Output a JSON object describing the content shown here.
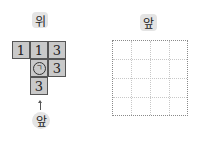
{
  "top_view": {
    "label": "위",
    "cells": [
      {
        "row": 0,
        "col": 0,
        "value": "1"
      },
      {
        "row": 0,
        "col": 1,
        "value": "1"
      },
      {
        "row": 0,
        "col": 2,
        "value": "3"
      },
      {
        "row": 1,
        "col": 1,
        "value": "ㄱ",
        "circled": true
      },
      {
        "row": 1,
        "col": 2,
        "value": "3"
      },
      {
        "row": 2,
        "col": 1,
        "value": "3"
      }
    ],
    "front_label": "앞",
    "arrow_icon": "arrow-up-icon"
  },
  "front_view": {
    "label": "앞",
    "grid": {
      "rows": 4,
      "cols": 4,
      "style": "dotted"
    }
  },
  "colors": {
    "cell_fill": "#c9c9c9",
    "cell_border": "#555555",
    "label_bg": "#e4e4e4",
    "grid_outer": "#8a8a8a",
    "grid_inner": "#c8c8c8"
  }
}
